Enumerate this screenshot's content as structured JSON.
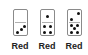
{
  "dominoes": [
    {
      "top": 0,
      "bottom": 3,
      "label": "Red"
    },
    {
      "top": 1,
      "bottom": 4,
      "label": "Red"
    },
    {
      "top": 2,
      "bottom": 5,
      "label": "Red"
    }
  ]
}
